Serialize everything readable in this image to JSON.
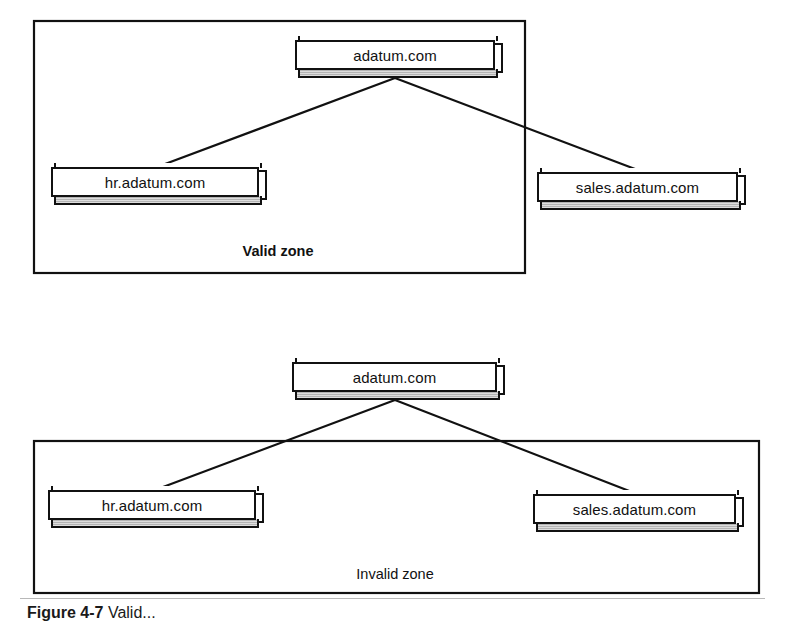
{
  "figure": {
    "caption_strong": "Figure 4-7",
    "caption_rest": "Valid...",
    "background_color": "#ffffff",
    "line_color": "#111111",
    "node_fill_color": "#ffffff",
    "node_shadow_color": "#b4b4b4"
  },
  "diagram_data": {
    "type": "diagram",
    "subtype": "dns-zone-hierarchy-comparison",
    "panels": [
      {
        "id": "valid",
        "zone_label": "Valid zone",
        "zone_label_bold": true,
        "zone_rect": {
          "x": 33,
          "y": 20,
          "width": 491,
          "height": 252
        },
        "parent_inside_zone": true,
        "nodes": [
          {
            "id": "root",
            "label": "adatum.com",
            "x": 295,
            "y": 40,
            "width": 200,
            "height": 30,
            "role": "parent"
          },
          {
            "id": "hr",
            "label": "hr.adatum.com",
            "x": 51,
            "y": 167,
            "width": 208,
            "height": 30,
            "role": "child"
          },
          {
            "id": "sales",
            "label": "sales.adatum.com",
            "x": 537,
            "y": 172,
            "width": 201,
            "height": 30,
            "role": "child"
          }
        ],
        "edges": [
          {
            "from": "root",
            "to": "hr",
            "x1": 395,
            "y1": 78,
            "x2": 157,
            "y2": 167
          },
          {
            "from": "root",
            "to": "sales",
            "x1": 395,
            "y1": 78,
            "x2": 643,
            "y2": 172
          }
        ],
        "caption_position": {
          "x": 278,
          "y": 243
        }
      },
      {
        "id": "invalid",
        "zone_label": "Invalid zone",
        "zone_label_bold": false,
        "zone_rect": {
          "x": 33,
          "y": 440,
          "width": 725,
          "height": 152
        },
        "parent_inside_zone": false,
        "nodes": [
          {
            "id": "root",
            "label": "adatum.com",
            "x": 292,
            "y": 362,
            "width": 205,
            "height": 30,
            "role": "parent"
          },
          {
            "id": "hr",
            "label": "hr.adatum.com",
            "x": 48,
            "y": 490,
            "width": 208,
            "height": 30,
            "role": "child"
          },
          {
            "id": "sales",
            "label": "sales.adatum.com",
            "x": 533,
            "y": 494,
            "width": 203,
            "height": 30,
            "role": "child"
          }
        ],
        "edges": [
          {
            "from": "root",
            "to": "hr",
            "x1": 395,
            "y1": 400,
            "x2": 155,
            "y2": 490
          },
          {
            "from": "root",
            "to": "sales",
            "x1": 395,
            "y1": 400,
            "x2": 637,
            "y2": 494
          }
        ],
        "caption_position": {
          "x": 395,
          "y": 566
        }
      }
    ]
  }
}
